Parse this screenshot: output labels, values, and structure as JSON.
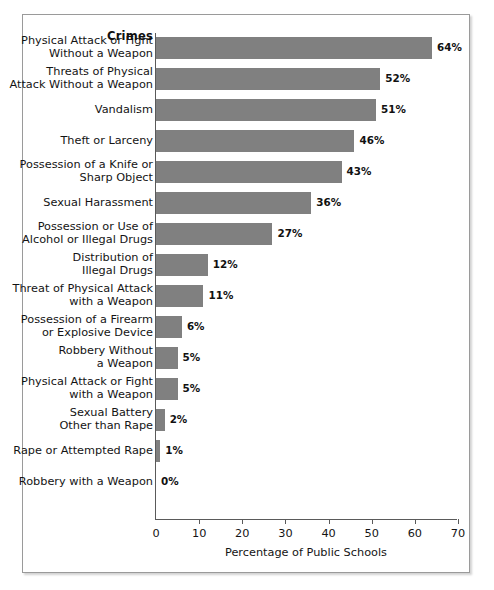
{
  "chart_data": {
    "type": "bar",
    "orientation": "horizontal",
    "title": "",
    "header_label": "Crimes",
    "xlabel": "Percentage of Public Schools",
    "ylabel": "Crimes",
    "xlim": [
      0,
      70
    ],
    "xticks": [
      0,
      10,
      20,
      30,
      40,
      50,
      60,
      70
    ],
    "xtick_labels": [
      "0",
      "10",
      "20",
      "30",
      "40",
      "50",
      "60",
      "70"
    ],
    "grid": false,
    "legend": "none",
    "bar_color": "#808080",
    "axis_color": "#5a5a5a",
    "categories": [
      "Physical Attack or Fight\nWithout a Weapon",
      "Threats of Physical\nAttack Without a Weapon",
      "Vandalism",
      "Theft or Larceny",
      "Possession of a Knife or\nSharp Object",
      "Sexual Harassment",
      "Possession or Use of\nAlcohol or Illegal Drugs",
      "Distribution of\nIllegal Drugs",
      "Threat of Physical Attack\nwith a Weapon",
      "Possession of a Firearm\nor Explosive Device",
      "Robbery Without\na Weapon",
      "Physical Attack or Fight\nwith a Weapon",
      "Sexual Battery\nOther than Rape",
      "Rape or Attempted Rape",
      "Robbery with a Weapon"
    ],
    "values": [
      64,
      52,
      51,
      46,
      43,
      36,
      27,
      12,
      11,
      6,
      5,
      5,
      2,
      1,
      0
    ],
    "value_labels": [
      "64%",
      "52%",
      "51%",
      "46%",
      "43%",
      "36%",
      "27%",
      "12%",
      "11%",
      "6%",
      "5%",
      "5%",
      "2%",
      "1%",
      "0%"
    ]
  }
}
